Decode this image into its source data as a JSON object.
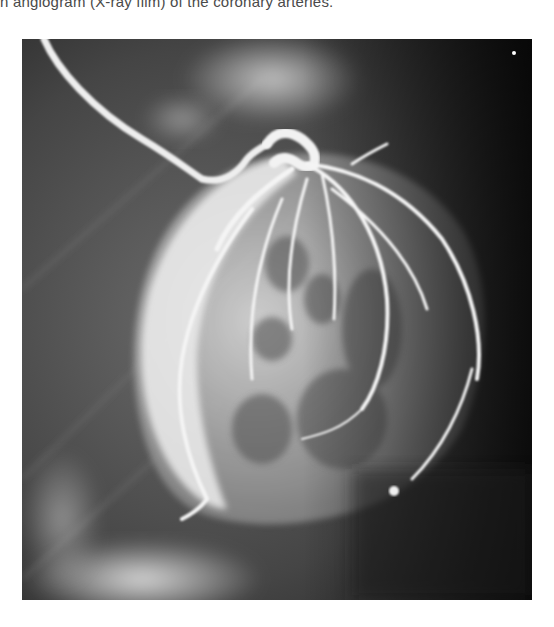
{
  "page": {
    "caption": "n angiogram (X-ray film) of the coronary arteries.",
    "figure": {
      "subject": "coronary angiogram",
      "description": "Black-and-white X-ray film showing contrast-filled coronary arteries over the heart, with a catheter entering from the upper left",
      "colors": {
        "background_dark": "#1e1e1e",
        "mid_gray": "#5a5a5a",
        "contrast_bright": "#f2f2f2"
      }
    }
  }
}
